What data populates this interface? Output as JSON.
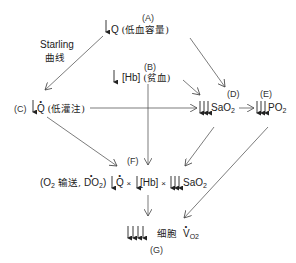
{
  "nodes": {
    "A": {
      "label": "(A)",
      "symbol": "Q",
      "desc": "(低血容量)"
    },
    "B": {
      "label": "(B)",
      "symbol": "[Hb]",
      "desc": "(贫血)"
    },
    "C": {
      "label": "(C)",
      "symbol": "Q",
      "desc": "(低灌注)"
    },
    "D": {
      "label": "(D)",
      "symbol": "SaO",
      "sub": "2"
    },
    "E": {
      "label": "(E)",
      "symbol": "PO",
      "sub": "2"
    },
    "F": {
      "label": "(F)",
      "prefix_o2": "(O",
      "prefix_sub": "2",
      "prefix_text": " 输送, ",
      "do2": "DO",
      "do2_sub": "2",
      "close": ")",
      "q": "Q",
      "times1": "×",
      "hb": "[Hb]",
      "times2": "×",
      "sao": "SaO",
      "sao_sub": "2"
    },
    "G": {
      "label": "(G)",
      "desc": "细胞",
      "v": "V",
      "v_sub": "O2"
    }
  },
  "starling": {
    "line1": "Starling",
    "line2": "曲线"
  }
}
